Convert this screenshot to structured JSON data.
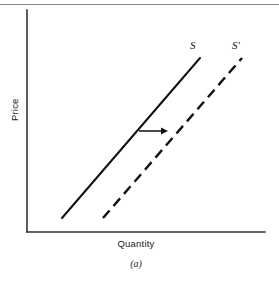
{
  "figure": {
    "caption": "(a)",
    "background_color": "#ffffff",
    "ink_color": "#111111"
  },
  "axes": {
    "y_label": "Price",
    "x_label": "Quantity",
    "axis_color": "#333333",
    "x_axis": {
      "x1": 27,
      "y1": 232,
      "x2": 265,
      "y2": 232
    },
    "y_axis": {
      "x1": 27,
      "y1": 10,
      "x2": 27,
      "y2": 232
    }
  },
  "annotations": {
    "shift_arrow": {
      "name": "rightward-shift-arrow",
      "x1": 139,
      "y1": 131,
      "x2": 168,
      "y2": 131,
      "direction": "right"
    }
  },
  "chart_data": {
    "type": "line",
    "title": "",
    "subtitle": "",
    "xlabel": "Quantity",
    "ylabel": "Price",
    "xlim": [
      0,
      100
    ],
    "ylim": [
      0,
      100
    ],
    "grid": false,
    "legend": "inline-end-labels",
    "annotation": "Rightward shift of the supply curve from S to S'",
    "series": [
      {
        "name": "S",
        "label": "S",
        "style": "solid",
        "color": "#111111",
        "points": [
          [
            62,
            218
          ],
          [
            200,
            58
          ]
        ],
        "label_position": [
          190,
          40
        ]
      },
      {
        "name": "S'",
        "label": "S'",
        "style": "dashed",
        "color": "#111111",
        "points": [
          [
            103,
            218
          ],
          [
            242,
            58
          ]
        ],
        "label_position": [
          232,
          40
        ]
      }
    ]
  }
}
